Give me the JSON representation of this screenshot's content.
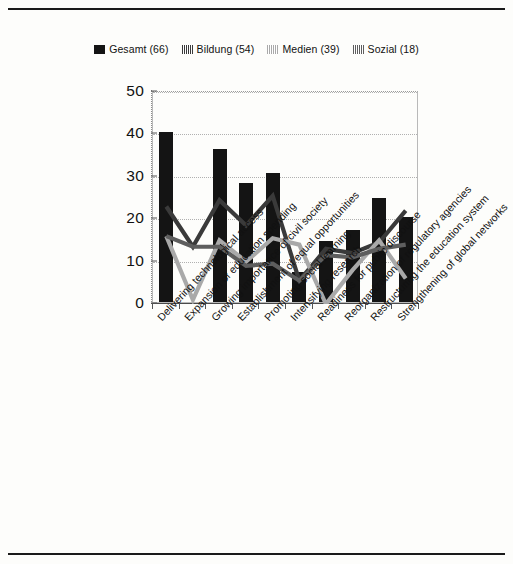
{
  "chart_data": {
    "type": "bar",
    "title": "",
    "subtitle": "",
    "xlabel": "",
    "ylabel": "",
    "ylim": [
      0,
      50
    ],
    "yticks": [
      0,
      10,
      20,
      30,
      40,
      50
    ],
    "grid": true,
    "legend_position": "top-center",
    "categories": [
      "Delivering technological access",
      "Expansion of education spending",
      "Growing importance of civil society",
      "Establishment of equal opportunities",
      "Promoting social learning",
      "Intensifying research",
      "Readiness for public discourse",
      "Reorganization of regulatory agencies",
      "Restructuring the education system",
      "Strengthening of global networks"
    ],
    "series": [
      {
        "name": "Gesamt (66)",
        "short_name": "Gesamt",
        "n": 66,
        "render": "bar",
        "color": "#141414",
        "values": [
          40,
          0,
          36,
          28,
          30.5,
          7,
          14.5,
          17,
          24.5,
          20
        ]
      },
      {
        "name": "Bildung (54)",
        "short_name": "Bildung",
        "n": 54,
        "render": "line",
        "color": "#3a3a3a",
        "values": [
          23,
          13.5,
          24.5,
          18.5,
          25.5,
          5.5,
          13,
          12,
          14.5,
          22
        ]
      },
      {
        "name": "Medien (39)",
        "short_name": "Medien",
        "n": 39,
        "render": "line",
        "color": "#a9a9a9",
        "values": [
          16,
          1,
          15,
          10,
          15.5,
          14,
          0,
          8,
          15,
          6
        ]
      },
      {
        "name": "Sozial (18)",
        "short_name": "Sozial",
        "n": 18,
        "render": "line",
        "color": "#5e5e5e",
        "values": [
          16,
          13.5,
          13.5,
          9,
          9.5,
          5.5,
          11.5,
          11,
          13,
          14
        ]
      }
    ]
  },
  "legend": {
    "items": [
      {
        "label": "Gesamt (66)",
        "swatch": "solid-dark",
        "color": "#141414"
      },
      {
        "label": "Bildung (54)",
        "swatch": "hatch-dark",
        "color": "#3a3a3a"
      },
      {
        "label": "Medien (39)",
        "swatch": "hatch-light",
        "color": "#a9a9a9"
      },
      {
        "label": "Sozial (18)",
        "swatch": "hatch-mid",
        "color": "#5e5e5e"
      }
    ]
  }
}
